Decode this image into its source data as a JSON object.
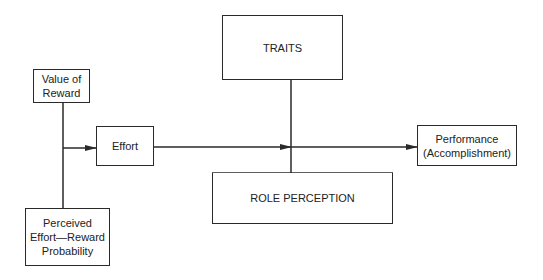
{
  "diagram": {
    "nodes": {
      "value_of_reward": "Value of\nReward",
      "perceived_probability": "Perceived\nEffort—Reward\nProbability",
      "effort": "Effort",
      "traits": "TRAITS",
      "role_perception": "ROLE PERCEPTION",
      "performance": "Performance\n(Accomplishment)"
    },
    "edges": [
      {
        "from": "value_of_reward",
        "to": "effort"
      },
      {
        "from": "perceived_probability",
        "to": "effort"
      },
      {
        "from": "effort",
        "to": "performance"
      },
      {
        "from": "traits",
        "to": "performance"
      },
      {
        "from": "role_perception",
        "to": "performance"
      }
    ],
    "line_color": "#2a2a2a"
  }
}
